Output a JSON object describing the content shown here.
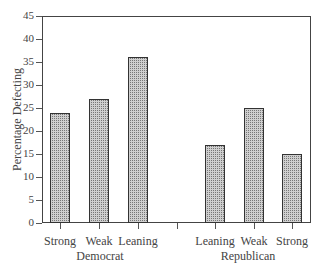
{
  "chart_data": {
    "type": "bar",
    "title": "",
    "xlabel": "",
    "ylabel": "Percentage Defecting",
    "ylim": [
      0,
      45
    ],
    "yticks": [
      0,
      5,
      10,
      15,
      20,
      25,
      30,
      35,
      40,
      45
    ],
    "grid": false,
    "groups": [
      {
        "name": "Democrat",
        "categories": [
          "Strong",
          "Weak",
          "Leaning"
        ],
        "values": [
          24,
          27,
          36
        ]
      },
      {
        "name": "Republican",
        "categories": [
          "Leaning",
          "Weak",
          "Strong"
        ],
        "values": [
          17,
          25,
          15
        ]
      }
    ],
    "categories": [
      "Strong",
      "Weak",
      "Leaning",
      "Leaning",
      "Weak",
      "Strong"
    ],
    "values": [
      24,
      27,
      36,
      17,
      25,
      15
    ]
  },
  "labels": {
    "ylabel": "Percentage Defecting",
    "yticks": [
      "0",
      "5",
      "10",
      "15",
      "20",
      "25",
      "30",
      "35",
      "40",
      "45"
    ],
    "dem_cats": [
      "Strong",
      "Weak",
      "Leaning"
    ],
    "rep_cats": [
      "Leaning",
      "Weak",
      "Strong"
    ],
    "dem_group": "Democrat",
    "rep_group": "Republican"
  }
}
